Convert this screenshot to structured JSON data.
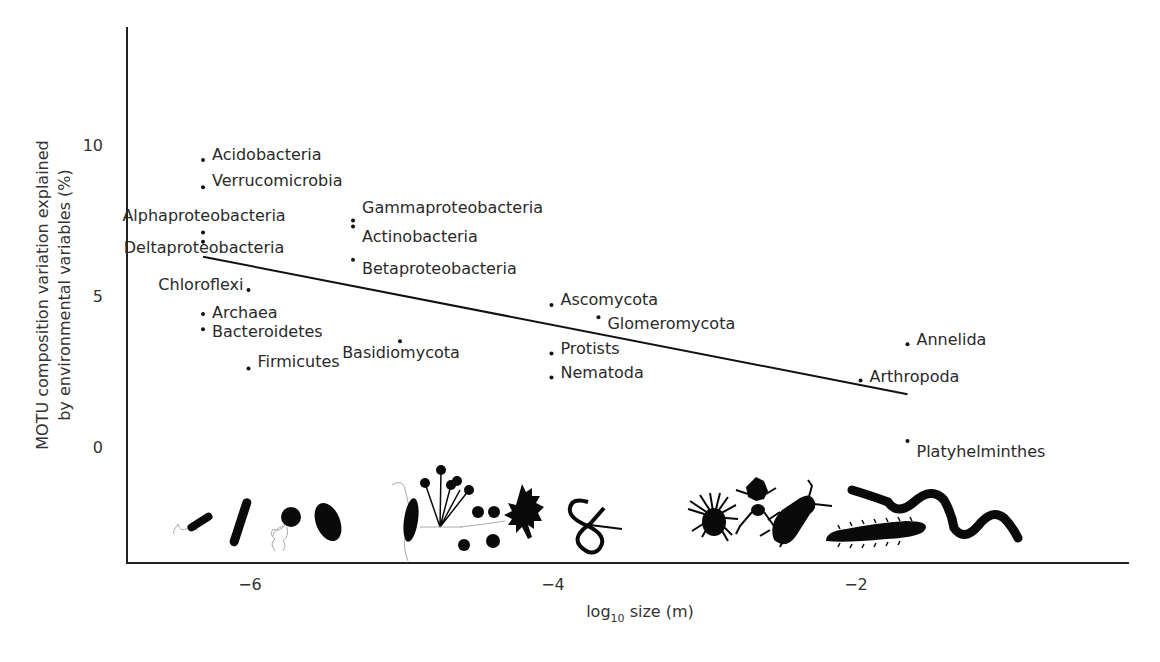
{
  "chart_data": {
    "type": "scatter",
    "title": "",
    "xlabel": "log10 size (m)",
    "xlabel_parts": {
      "base": "log",
      "sub": "10",
      "rest": " size (m)"
    },
    "ylabel_line1": "MOTU composition variation explained",
    "ylabel_line2": "by environmental variables (%)",
    "ylabel": "MOTU composition variation explained by environmental variables (%)",
    "xlim": [
      -6.8,
      -0.15
    ],
    "ylim": [
      -3.8,
      13.9
    ],
    "xticks": [
      -6,
      -4,
      -2
    ],
    "xtick_labels": [
      "−6",
      "−4",
      "−2"
    ],
    "yticks": [
      0,
      5,
      10
    ],
    "ytick_labels": [
      "0",
      "5",
      "10"
    ],
    "grid": false,
    "legend": null,
    "points": [
      {
        "name": "Acidobacteria",
        "x": -6.31,
        "y": 9.5,
        "label_side": "right",
        "dy": -6
      },
      {
        "name": "Verrucomicrobia",
        "x": -6.31,
        "y": 8.6,
        "label_side": "right",
        "dy": -7
      },
      {
        "name": "Alphaproteobacteria",
        "x": -6.31,
        "y": 7.1,
        "label_side": "left-above",
        "dy": -18
      },
      {
        "name": "Deltaproteobacteria",
        "x": -6.31,
        "y": 6.8,
        "label_side": "center-below",
        "dy": 5
      },
      {
        "name": "Gammaproteobacteria",
        "x": -5.32,
        "y": 7.5,
        "label_side": "right",
        "dy": -14
      },
      {
        "name": "Actinobacteria",
        "x": -5.32,
        "y": 7.3,
        "label_side": "right",
        "dy": 9
      },
      {
        "name": "Betaproteobacteria",
        "x": -5.32,
        "y": 6.2,
        "label_side": "right",
        "dy": 8
      },
      {
        "name": "Chloroflexi",
        "x": -6.01,
        "y": 5.2,
        "label_side": "left",
        "dy": -6
      },
      {
        "name": "Archaea",
        "x": -6.31,
        "y": 4.4,
        "label_side": "right",
        "dy": -2
      },
      {
        "name": "Bacteroidetes",
        "x": -6.31,
        "y": 3.9,
        "label_side": "right",
        "dy": 2
      },
      {
        "name": "Firmicutes",
        "x": -6.01,
        "y": 2.6,
        "label_side": "right",
        "dy": -7
      },
      {
        "name": "Basidiomycota",
        "x": -5.01,
        "y": 3.5,
        "label_side": "center-below",
        "dy": 11
      },
      {
        "name": "Ascomycota",
        "x": -4.01,
        "y": 4.7,
        "label_side": "right",
        "dy": -6
      },
      {
        "name": "Glomeromycota",
        "x": -3.7,
        "y": 4.3,
        "label_side": "right",
        "dy": 6
      },
      {
        "name": "Protists",
        "x": -4.01,
        "y": 3.1,
        "label_side": "right",
        "dy": -5
      },
      {
        "name": "Nematoda",
        "x": -4.01,
        "y": 2.3,
        "label_side": "right",
        "dy": -6
      },
      {
        "name": "Annelida",
        "x": -1.66,
        "y": 3.4,
        "label_side": "right",
        "dy": -5
      },
      {
        "name": "Arthropoda",
        "x": -1.97,
        "y": 2.2,
        "label_side": "right",
        "dy": -5
      },
      {
        "name": "Platyhelminthes",
        "x": -1.66,
        "y": 0.2,
        "label_side": "right",
        "dy": 10
      }
    ],
    "trend_line": {
      "x0": -6.31,
      "y0": 6.3,
      "x1": -1.66,
      "y1": 1.75
    },
    "annotations": [
      "organism silhouettes along x-axis: bacteria, fungi, protists, nematode, arthropods, annelid"
    ]
  },
  "silhouettes": [
    "bacterium-flagellated-icon",
    "bacterium-rod-icon",
    "bacterium-coccus-flagellated-icon",
    "bacterium-oval-icon",
    "protist-flagellate-icon",
    "fungus-sporangia-icon",
    "fungus-hyphae-icon",
    "amoeba-icon",
    "nematode-icon",
    "mite-icon",
    "ant-icon",
    "beetle-icon",
    "millipede-icon",
    "earthworm-icon"
  ]
}
